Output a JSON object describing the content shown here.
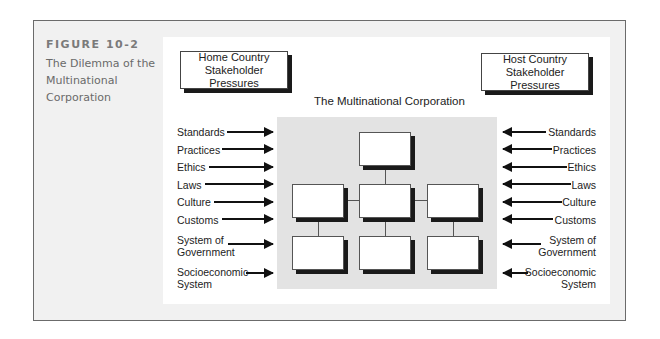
{
  "figure": {
    "number": "FIGURE 10-2",
    "title_lines": [
      "The Dilemma of the",
      "Multinational",
      "Corporation"
    ]
  },
  "diagram": {
    "home_box": [
      "Home Country",
      "Stakeholder Pressures"
    ],
    "host_box": [
      "Host Country",
      "Stakeholder Pressures"
    ],
    "center_title": "The Multinational Corporation",
    "left_pressures": [
      "Standards",
      "Practices",
      "Ethics",
      "Laws",
      "Culture",
      "Customs",
      "System of Government",
      "Socioeconomic System"
    ],
    "right_pressures": [
      "Standards",
      "Practices",
      "Ethics",
      "Laws",
      "Culture",
      "Customs",
      "System of Government",
      "Socioeconomic System"
    ],
    "left_labels": {
      "l0": "Standards",
      "l1": "Practices",
      "l2": "Ethics",
      "l3": "Laws",
      "l4": "Culture",
      "l5": "Customs",
      "l6a": "System of",
      "l6b": "Government",
      "l7a": "Socioeconomic",
      "l7b": "System"
    },
    "right_labels": {
      "l0": "Standards",
      "l1": "Practices",
      "l2": "Ethics",
      "l3": "Laws",
      "l4": "Culture",
      "l5": "Customs",
      "l6a": "System of",
      "l6b": "Government",
      "l7a": "Socioeconomic",
      "l7b": "System"
    },
    "org_chart": {
      "levels": 3,
      "boxes_per_level": [
        1,
        3,
        3
      ]
    }
  }
}
